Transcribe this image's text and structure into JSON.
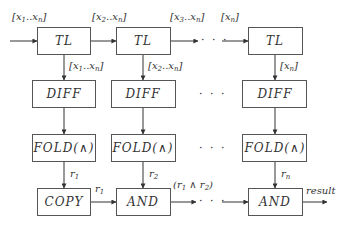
{
  "diagram": {
    "type": "dataflow",
    "columns": [
      {
        "tl": {
          "label": "TL"
        },
        "input_label": {
          "base": "[x",
          "s1": "1",
          "mid": "..x",
          "s2": "n",
          "end": "]"
        },
        "down_label": {
          "base": "[x",
          "s1": "1",
          "mid": "..x",
          "s2": "n",
          "end": "]"
        },
        "diff": {
          "label": "DIFF"
        },
        "fold": {
          "label": "FOLD(∧)"
        },
        "result_label": {
          "base": "r",
          "sub": "1"
        },
        "combine": {
          "label": "COPY"
        }
      },
      {
        "tl": {
          "label": "TL"
        },
        "input_label": {
          "base": "[x",
          "s1": "2",
          "mid": "..x",
          "s2": "n",
          "end": "]"
        },
        "down_label": {
          "base": "[x",
          "s1": "2",
          "mid": "..x",
          "s2": "n",
          "end": "]"
        },
        "diff": {
          "label": "DIFF"
        },
        "fold": {
          "label": "FOLD(∧)"
        },
        "result_label": {
          "base": "r",
          "sub": "2"
        },
        "combine": {
          "label": "AND"
        }
      },
      {
        "tl": {
          "label": "TL"
        },
        "input_label": {
          "base": "[x",
          "s1": "n",
          "end": "]"
        },
        "down_label": {
          "base": "[x",
          "s1": "n",
          "end": "]"
        },
        "diff": {
          "label": "DIFF"
        },
        "fold": {
          "label": "FOLD(∧)"
        },
        "result_label": {
          "base": "r",
          "sub": "n"
        },
        "combine": {
          "label": "AND"
        }
      }
    ],
    "top_chain_label_col2_out": {
      "base": "[x",
      "s1": "3",
      "mid": "..x",
      "s2": "n",
      "end": "]"
    },
    "copy_to_and_label": {
      "base": "r",
      "sub": "1"
    },
    "and_chain_label": {
      "open": "(r",
      "s1": "1",
      "op": " ∧ r",
      "s2": "2",
      "close": ")"
    },
    "output_label": "result",
    "ellipsis": "· · ·"
  }
}
